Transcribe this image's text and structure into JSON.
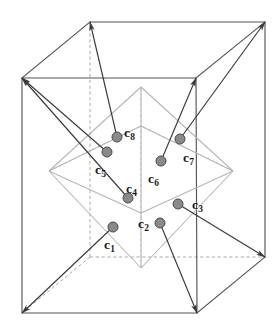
{
  "figure": {
    "type": "3d-lattice-diagram",
    "width": 278,
    "height": 327,
    "background_color": "#ffffff"
  },
  "colors": {
    "cube_edge": "#555555",
    "cube_hidden_edge": "#b0a8a0",
    "octahedron_edge": "#b5b5b5",
    "octahedron_hidden_edge": "#cfc8c4",
    "dot_fill": "#8a8a8a",
    "dot_stroke": "#4a4a4a",
    "arrow": "#3a3a3a",
    "label_text": "#1a1a1a"
  },
  "cube": {
    "name": "unit-cell",
    "front_face": {
      "top_left": [
        22,
        78
      ],
      "top_right": [
        196,
        78
      ],
      "bottom_right": [
        197,
        313
      ],
      "bottom_left": [
        22,
        313
      ]
    },
    "back_face": {
      "top_left": [
        90,
        22
      ],
      "top_right": [
        265,
        22
      ],
      "bottom_right": [
        265,
        257
      ],
      "bottom_left": [
        90,
        257
      ]
    },
    "hidden_corner": [
      90,
      257
    ],
    "depth_offset": [
      68,
      -56
    ]
  },
  "octahedron": {
    "name": "coordination-octahedron",
    "top": [
      141,
      87
    ],
    "bottom": [
      141,
      268
    ],
    "left": [
      49,
      171
    ],
    "right": [
      233,
      171
    ],
    "front": [
      141,
      213
    ],
    "back": [
      141,
      126
    ]
  },
  "sites": [
    {
      "id": "c1",
      "label": "c",
      "subscript": "1",
      "dot": [
        113,
        227
      ],
      "label_pos": [
        104,
        238
      ],
      "bond_to": [
        22,
        313
      ],
      "arrow": true
    },
    {
      "id": "c2",
      "label": "c",
      "subscript": "2",
      "dot": [
        160,
        223
      ],
      "label_pos": [
        138,
        217
      ],
      "bond_to": [
        197,
        313
      ],
      "arrow": true
    },
    {
      "id": "c3",
      "label": "c",
      "subscript": "3",
      "dot": [
        178,
        204
      ],
      "label_pos": [
        192,
        198
      ],
      "bond_to": [
        265,
        257
      ],
      "arrow": true
    },
    {
      "id": "c4",
      "label": "c",
      "subscript": "4",
      "dot": [
        128,
        198
      ],
      "label_pos": [
        126,
        182
      ],
      "bond_to": [
        22,
        78
      ],
      "arrow": true
    },
    {
      "id": "c5",
      "label": "c",
      "subscript": "5",
      "dot": [
        107,
        152
      ],
      "label_pos": [
        95,
        163
      ],
      "bond_to": [
        22,
        78
      ],
      "arrow": true
    },
    {
      "id": "c6",
      "label": "c",
      "subscript": "6",
      "dot": [
        161,
        161
      ],
      "label_pos": [
        148,
        172
      ],
      "bond_to": [
        196,
        78
      ],
      "arrow": true
    },
    {
      "id": "c7",
      "label": "c",
      "subscript": "7",
      "dot": [
        180,
        139
      ],
      "label_pos": [
        183,
        151
      ],
      "bond_to": [
        265,
        22
      ],
      "arrow": true
    },
    {
      "id": "c8",
      "label": "c",
      "subscript": "8",
      "dot": [
        117,
        137
      ],
      "label_pos": [
        124,
        126
      ],
      "bond_to": [
        90,
        22
      ],
      "arrow": true
    }
  ]
}
